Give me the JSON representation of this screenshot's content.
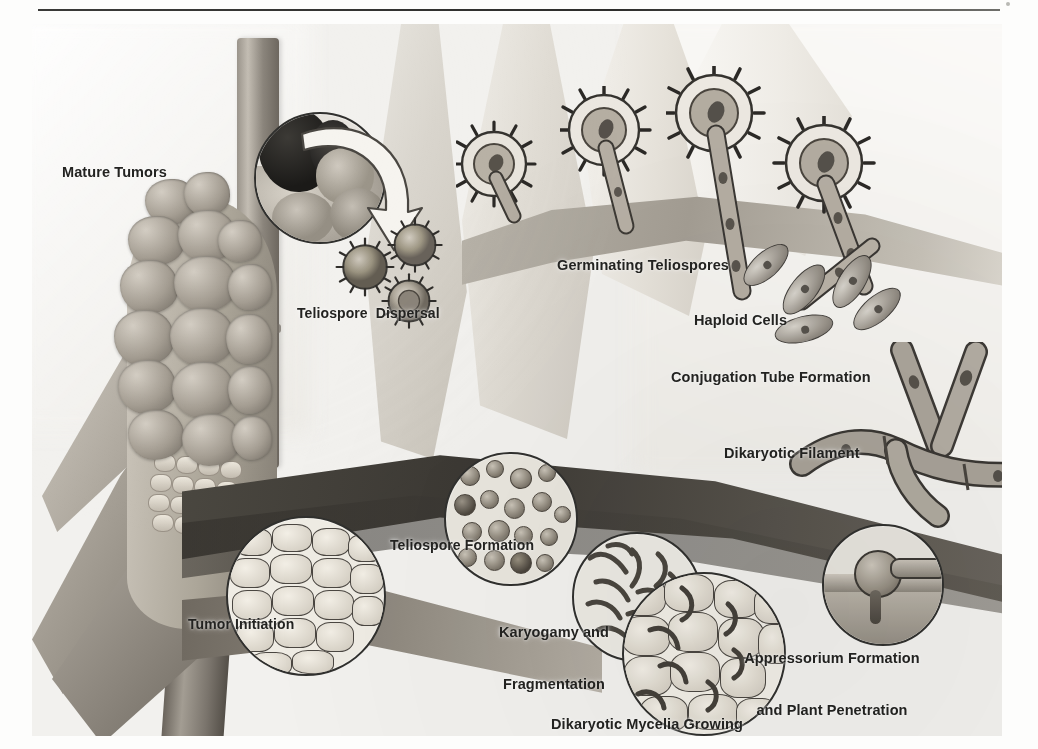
{
  "figure": {
    "kind": "scientific-illustration",
    "palette": "grayscale halftone print scan",
    "divider_rule": true
  },
  "labels": {
    "mature_tumors": "Mature Tumors",
    "teliospore_dispersal": "Teliospore  Dispersal",
    "germinating_teliospores": "Germinating Teliospores",
    "haploid_cells": "Haploid Cells",
    "conjugation_tube_formation": "Conjugation Tube Formation",
    "dikaryotic_filament": "Dikaryotic Filament",
    "tumor_initiation": "Tumor Initiation",
    "teliospore_formation": "Teliospore Formation",
    "karyogamy_line1": "Karyogamy and",
    "karyogamy_line2": "Fragmentation",
    "dikaryotic_mycelia_line1": "Dikaryotic Mycelia Growing",
    "dikaryotic_mycelia_line2": "Through and Between Cells",
    "appressorium_line1": "Appressorium Formation",
    "appressorium_line2": "and Plant Penetration"
  },
  "colors": {
    "ink": "#232321",
    "rule": "#33332f",
    "plate_bg": "#f2f1ee",
    "leaf_dark": "#4c4942",
    "leaf_mid": "#a9a49a",
    "leaf_light": "#dedad2",
    "stalk": "#8d8780",
    "gall": "#a49d92",
    "inset_border": "#30302e"
  },
  "stages": [
    {
      "id": "mature-tumors",
      "label": "Mature Tumors",
      "order": 1
    },
    {
      "id": "teliospore-dispersal",
      "label": "Teliospore  Dispersal",
      "order": 2
    },
    {
      "id": "germinating-teliospores",
      "label": "Germinating Teliospores",
      "order": 3,
      "count": 4
    },
    {
      "id": "haploid-cells",
      "label": "Haploid Cells",
      "order": 4,
      "count": 5
    },
    {
      "id": "conjugation-tube-formation",
      "label": "Conjugation Tube Formation",
      "order": 5
    },
    {
      "id": "dikaryotic-filament",
      "label": "Dikaryotic Filament",
      "order": 6
    },
    {
      "id": "appressorium-formation",
      "label": "Appressorium Formation and Plant Penetration",
      "order": 7
    },
    {
      "id": "dikaryotic-mycelia",
      "label": "Dikaryotic Mycelia Growing Through and Between Cells",
      "order": 8
    },
    {
      "id": "karyogamy-fragmentation",
      "label": "Karyogamy and Fragmentation",
      "order": 9
    },
    {
      "id": "teliospore-formation",
      "label": "Teliospore Formation",
      "order": 10
    },
    {
      "id": "tumor-initiation",
      "label": "Tumor Initiation",
      "order": 11
    }
  ]
}
